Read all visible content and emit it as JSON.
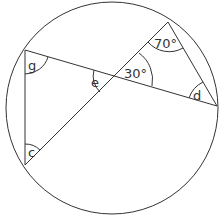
{
  "diagram": {
    "type": "circle-geometry",
    "stroke_color": "#333333",
    "circle": {
      "cx": 112,
      "cy": 108,
      "r": 106
    },
    "points": {
      "top_left": [
        25,
        50
      ],
      "bottom_left": [
        25,
        165
      ],
      "top_right": [
        168,
        22
      ],
      "right": [
        217,
        106
      ],
      "intersection": [
        116,
        76
      ]
    },
    "labels": {
      "g": "g",
      "e": "e",
      "c": "c",
      "d": "d",
      "angle_top": "70°",
      "angle_center": "30°"
    }
  }
}
